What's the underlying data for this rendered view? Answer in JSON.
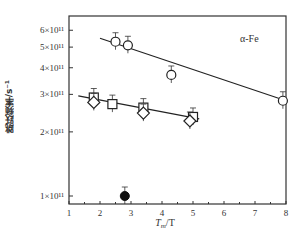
{
  "chart_data": {
    "type": "scatter",
    "title": "",
    "annotation": "α-Fe",
    "xlabel": "Tm/T",
    "xlabel_main": "T",
    "xlabel_sub": "m",
    "xlabel_tail": "/T",
    "ylabel": "跳跃频率/s⁻¹",
    "xlim": [
      1,
      8
    ],
    "ylim": [
      90000000000.0,
      700000000000.0
    ],
    "yscale": "log",
    "x_ticks": [
      "1",
      "2",
      "3",
      "4",
      "5",
      "6",
      "7",
      "8"
    ],
    "y_ticks": [
      "1×10¹¹",
      "2×10¹¹",
      "3×10¹¹",
      "4×10¹¹",
      "5×10¹¹",
      "6×10¹¹"
    ],
    "series": [
      {
        "name": "open circles",
        "marker": "circle-open",
        "x": [
          2.5,
          2.9,
          4.3,
          7.9
        ],
        "y": [
          530000000000.0,
          510000000000.0,
          370000000000.0,
          280000000000.0
        ]
      },
      {
        "name": "open squares",
        "marker": "square-open",
        "x": [
          1.8,
          2.4,
          3.4,
          5.0
        ],
        "y": [
          290000000000.0,
          270000000000.0,
          260000000000.0,
          235000000000.0
        ]
      },
      {
        "name": "open diamonds",
        "marker": "diamond-open",
        "x": [
          1.8,
          3.4,
          4.9
        ],
        "y": [
          275000000000.0,
          245000000000.0,
          225000000000.0
        ]
      },
      {
        "name": "filled circle",
        "marker": "circle-filled",
        "x": [
          2.8
        ],
        "y": [
          100000000000.0
        ]
      }
    ],
    "fit_lines": [
      {
        "name": "upper fit",
        "x": [
          2.0,
          8.0
        ],
        "y": [
          550000000000.0,
          280000000000.0
        ]
      },
      {
        "name": "lower fit",
        "x": [
          1.3,
          5.2
        ],
        "y": [
          295000000000.0,
          230000000000.0
        ]
      }
    ],
    "grid": false,
    "legend": null
  }
}
